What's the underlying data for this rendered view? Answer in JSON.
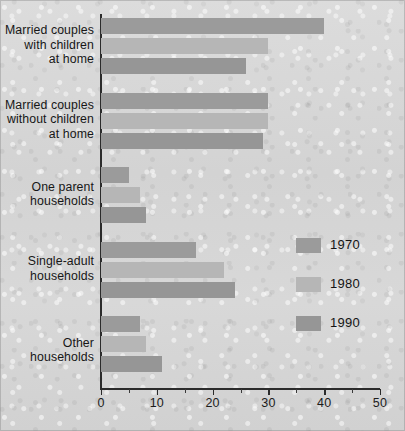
{
  "chart_data": {
    "type": "bar",
    "orientation": "horizontal",
    "title": "",
    "subtitle": "",
    "xlabel": "",
    "ylabel": "",
    "xlim": [
      0,
      50
    ],
    "grid": false,
    "legend_position": "right-middle",
    "categories": [
      "Married couples\nwith children\nat home",
      "Married couples\nwithout children\nat home",
      "One parent\nhouseholds",
      "Single-adult\nhouseholds",
      "Other households"
    ],
    "series": [
      {
        "name": "1970",
        "color": "#9b9b9b",
        "values": [
          40,
          30,
          5,
          17,
          7
        ]
      },
      {
        "name": "1980",
        "color": "#b6b6b6",
        "values": [
          30,
          30,
          7,
          22,
          8
        ]
      },
      {
        "name": "1990",
        "color": "#969696",
        "values": [
          26,
          29,
          8,
          24,
          11
        ]
      }
    ],
    "x_ticks_major": [
      0,
      10,
      20,
      30,
      40,
      50
    ],
    "x_tick_labels": [
      "0",
      "10",
      "20",
      "30",
      "40",
      "50"
    ],
    "x_ticks_minor": [
      5,
      15,
      25,
      35,
      45
    ],
    "axis_color": "#2b2b2b",
    "background_color": "#d6d6d6"
  },
  "legend": {
    "items": [
      {
        "label": "1970",
        "color": "#9b9b9b"
      },
      {
        "label": "1980",
        "color": "#b6b6b6"
      },
      {
        "label": "1990",
        "color": "#969696"
      }
    ]
  },
  "axis": {
    "labels": [
      "0",
      "10",
      "20",
      "30",
      "40",
      "50"
    ]
  },
  "categories": {
    "c0": "Married couples\nwith children\nat home",
    "c1": "Married couples\nwithout children\nat home",
    "c2": "One parent\nhouseholds",
    "c3": "Single-adult\nhouseholds",
    "c4": "Other households"
  }
}
